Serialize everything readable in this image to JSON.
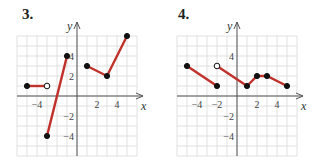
{
  "chart_data": [
    {
      "type": "line",
      "title": "3.",
      "xlabel": "x",
      "ylabel": "y",
      "xlim": [
        -6,
        6
      ],
      "ylim": [
        -6,
        6
      ],
      "grid": true,
      "x_ticks": [
        "-4",
        "2",
        "4"
      ],
      "y_ticks": [
        "4",
        "2",
        "-2",
        "-4"
      ],
      "segments": [
        {
          "points": [
            [
              -5,
              1
            ],
            [
              -3,
              1
            ]
          ],
          "endpoints": [
            "closed",
            "open"
          ]
        },
        {
          "points": [
            [
              -3,
              -4
            ],
            [
              -1,
              4
            ]
          ],
          "endpoints": [
            "closed",
            "closed"
          ]
        },
        {
          "points": [
            [
              1,
              3
            ],
            [
              3,
              2
            ],
            [
              5,
              6
            ]
          ],
          "endpoints": [
            "closed",
            "closed",
            "closed"
          ]
        }
      ]
    },
    {
      "type": "line",
      "title": "4.",
      "xlabel": "x",
      "ylabel": "y",
      "xlim": [
        -6,
        6
      ],
      "ylim": [
        -6,
        6
      ],
      "grid": true,
      "x_ticks": [
        "-4",
        "-2",
        "2",
        "4"
      ],
      "y_ticks": [
        "4",
        "-2",
        "-4"
      ],
      "segments": [
        {
          "points": [
            [
              -5,
              3
            ],
            [
              -2,
              1
            ]
          ],
          "endpoints": [
            "closed",
            "closed"
          ]
        },
        {
          "points": [
            [
              -2,
              3
            ],
            [
              1,
              1
            ],
            [
              2,
              2
            ],
            [
              3,
              2
            ],
            [
              5,
              1
            ]
          ],
          "endpoints": [
            "open",
            "closed",
            "closed",
            "closed",
            "closed"
          ]
        }
      ]
    }
  ],
  "labels": {
    "graph3": "3.",
    "graph4": "4.",
    "x": "x",
    "y": "y"
  },
  "colors": {
    "line": "#c0312b",
    "grid": "#d9d9d9",
    "axis": "#555555",
    "point": "#111111"
  }
}
